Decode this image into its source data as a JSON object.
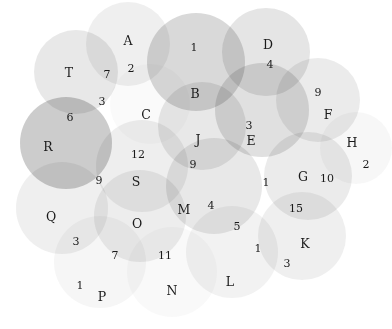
{
  "figure": {
    "kind": "area-proportional-venn-diagram",
    "background_color": "#ffffff",
    "width": 392,
    "height": 329,
    "label_color": "#1a1a1a"
  },
  "chart_data": {
    "type": "venn",
    "title": "",
    "xlabel": "",
    "ylabel": "",
    "legend": "none",
    "grid": false,
    "set_labels": [
      "A",
      "B",
      "C",
      "D",
      "E",
      "F",
      "G",
      "H",
      "J",
      "K",
      "L",
      "M",
      "N",
      "O",
      "P",
      "Q",
      "R",
      "S",
      "T"
    ],
    "region_counts": [
      1,
      2,
      3,
      4,
      5,
      6,
      7,
      9,
      10,
      11,
      12,
      15
    ],
    "circles": [
      {
        "id": "A",
        "label": "A",
        "cx": 128,
        "cy": 44,
        "r": 42,
        "fill": "#c9c9c9",
        "opacity": 0.3
      },
      {
        "id": "B",
        "label": "B",
        "cx": 196,
        "cy": 62,
        "r": 49,
        "fill": "#9a9a9a",
        "opacity": 0.38
      },
      {
        "id": "D",
        "label": "D",
        "cx": 266,
        "cy": 52,
        "r": 44,
        "fill": "#b0b0b0",
        "opacity": 0.33
      },
      {
        "id": "F",
        "label": "F",
        "cx": 318,
        "cy": 100,
        "r": 42,
        "fill": "#bdbdbd",
        "opacity": 0.3
      },
      {
        "id": "H",
        "label": "H",
        "cx": 356,
        "cy": 148,
        "r": 36,
        "fill": "#e2e2e2",
        "opacity": 0.26
      },
      {
        "id": "T",
        "label": "T",
        "cx": 76,
        "cy": 72,
        "r": 42,
        "fill": "#bcbcbc",
        "opacity": 0.34
      },
      {
        "id": "C",
        "label": "C",
        "cx": 150,
        "cy": 104,
        "r": 40,
        "fill": "#e6e6e6",
        "opacity": 0.22
      },
      {
        "id": "E",
        "label": "E",
        "cx": 262,
        "cy": 110,
        "r": 47,
        "fill": "#a8a8a8",
        "opacity": 0.36
      },
      {
        "id": "J",
        "label": "J",
        "cx": 202,
        "cy": 126,
        "r": 44,
        "fill": "#b8b8b8",
        "opacity": 0.32
      },
      {
        "id": "R",
        "label": "R",
        "cx": 66,
        "cy": 143,
        "r": 46,
        "fill": "#909090",
        "opacity": 0.46
      },
      {
        "id": "S",
        "label": "S",
        "cx": 142,
        "cy": 166,
        "r": 46,
        "fill": "#c6c6c6",
        "opacity": 0.3
      },
      {
        "id": "G",
        "label": "G",
        "cx": 308,
        "cy": 176,
        "r": 44,
        "fill": "#bdbdbd",
        "opacity": 0.3
      },
      {
        "id": "M",
        "label": "M",
        "cx": 214,
        "cy": 186,
        "r": 48,
        "fill": "#b6b6b6",
        "opacity": 0.32
      },
      {
        "id": "Q",
        "label": "Q",
        "cx": 62,
        "cy": 208,
        "r": 46,
        "fill": "#cacaca",
        "opacity": 0.3
      },
      {
        "id": "O",
        "label": "O",
        "cx": 140,
        "cy": 216,
        "r": 46,
        "fill": "#c2c2c2",
        "opacity": 0.3
      },
      {
        "id": "K",
        "label": "K",
        "cx": 302,
        "cy": 236,
        "r": 44,
        "fill": "#cbcbcb",
        "opacity": 0.3
      },
      {
        "id": "L",
        "label": "L",
        "cx": 232,
        "cy": 252,
        "r": 46,
        "fill": "#d2d2d2",
        "opacity": 0.28
      },
      {
        "id": "P",
        "label": "P",
        "cx": 100,
        "cy": 262,
        "r": 46,
        "fill": "#dcdcdc",
        "opacity": 0.26
      },
      {
        "id": "N",
        "label": "N",
        "cx": 172,
        "cy": 272,
        "r": 45,
        "fill": "#e4e4e4",
        "opacity": 0.24
      }
    ],
    "labels": [
      {
        "text": "A",
        "x": 128,
        "y": 41,
        "kind": "set"
      },
      {
        "text": "2",
        "x": 131,
        "y": 68,
        "kind": "count"
      },
      {
        "text": "T",
        "x": 69,
        "y": 73,
        "kind": "set"
      },
      {
        "text": "7",
        "x": 107,
        "y": 74,
        "kind": "count"
      },
      {
        "text": "1",
        "x": 194,
        "y": 47,
        "kind": "count"
      },
      {
        "text": "D",
        "x": 268,
        "y": 45,
        "kind": "set"
      },
      {
        "text": "4",
        "x": 270,
        "y": 64,
        "kind": "count"
      },
      {
        "text": "B",
        "x": 195,
        "y": 94,
        "kind": "set"
      },
      {
        "text": "3",
        "x": 102,
        "y": 101,
        "kind": "count"
      },
      {
        "text": "9",
        "x": 318,
        "y": 92,
        "kind": "count"
      },
      {
        "text": "C",
        "x": 146,
        "y": 115,
        "kind": "set"
      },
      {
        "text": "F",
        "x": 328,
        "y": 115,
        "kind": "set"
      },
      {
        "text": "6",
        "x": 70,
        "y": 117,
        "kind": "count"
      },
      {
        "text": "3",
        "x": 249,
        "y": 125,
        "kind": "count"
      },
      {
        "text": "J",
        "x": 198,
        "y": 140,
        "kind": "set"
      },
      {
        "text": "E",
        "x": 251,
        "y": 141,
        "kind": "set"
      },
      {
        "text": "H",
        "x": 352,
        "y": 143,
        "kind": "set"
      },
      {
        "text": "R",
        "x": 48,
        "y": 147,
        "kind": "set"
      },
      {
        "text": "12",
        "x": 138,
        "y": 154,
        "kind": "count"
      },
      {
        "text": "9",
        "x": 193,
        "y": 164,
        "kind": "count"
      },
      {
        "text": "2",
        "x": 366,
        "y": 164,
        "kind": "count"
      },
      {
        "text": "9",
        "x": 99,
        "y": 180,
        "kind": "count"
      },
      {
        "text": "S",
        "x": 136,
        "y": 182,
        "kind": "set"
      },
      {
        "text": "1",
        "x": 266,
        "y": 182,
        "kind": "count"
      },
      {
        "text": "G",
        "x": 303,
        "y": 177,
        "kind": "set"
      },
      {
        "text": "10",
        "x": 327,
        "y": 178,
        "kind": "count"
      },
      {
        "text": "Q",
        "x": 51,
        "y": 217,
        "kind": "set"
      },
      {
        "text": "M",
        "x": 184,
        "y": 210,
        "kind": "set"
      },
      {
        "text": "4",
        "x": 211,
        "y": 205,
        "kind": "count"
      },
      {
        "text": "15",
        "x": 296,
        "y": 208,
        "kind": "count"
      },
      {
        "text": "O",
        "x": 137,
        "y": 224,
        "kind": "set"
      },
      {
        "text": "5",
        "x": 237,
        "y": 226,
        "kind": "count"
      },
      {
        "text": "3",
        "x": 76,
        "y": 241,
        "kind": "count"
      },
      {
        "text": "7",
        "x": 115,
        "y": 255,
        "kind": "count"
      },
      {
        "text": "11",
        "x": 165,
        "y": 255,
        "kind": "count"
      },
      {
        "text": "1",
        "x": 258,
        "y": 248,
        "kind": "count"
      },
      {
        "text": "K",
        "x": 305,
        "y": 244,
        "kind": "set"
      },
      {
        "text": "3",
        "x": 287,
        "y": 263,
        "kind": "count"
      },
      {
        "text": "1",
        "x": 80,
        "y": 285,
        "kind": "count"
      },
      {
        "text": "L",
        "x": 230,
        "y": 282,
        "kind": "set"
      },
      {
        "text": "P",
        "x": 102,
        "y": 297,
        "kind": "set"
      },
      {
        "text": "N",
        "x": 172,
        "y": 291,
        "kind": "set"
      }
    ]
  }
}
